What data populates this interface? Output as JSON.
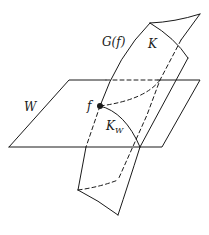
{
  "diagram": {
    "labels": {
      "graph": "G(f)",
      "region": "K",
      "plane": "W",
      "point": "f",
      "intersection_main": "K",
      "intersection_sub": "W"
    },
    "colors": {
      "stroke": "#1a1a1a",
      "background": "#ffffff"
    }
  }
}
